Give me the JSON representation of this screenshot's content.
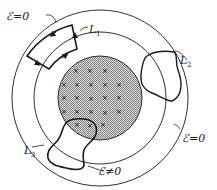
{
  "figure": {
    "labels": {
      "e_zero_top": "ℰ=0",
      "e_zero_right": "ℰ=0",
      "e_nonzero": "ℰ≠0",
      "L1": "L",
      "L1_sub": "1",
      "L2": "L",
      "L2_sub": "2",
      "L3": "L",
      "L3_sub": "3"
    },
    "colors": {
      "line": "#1a1a1a",
      "shade": "#b9b9b9",
      "background": "#ffffff"
    },
    "regions": {
      "shaded_disk_marks": "×",
      "mark_count": 24
    }
  }
}
